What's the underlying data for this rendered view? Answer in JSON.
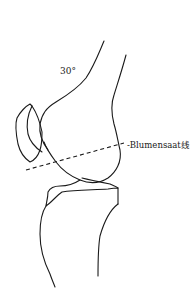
{
  "diagram": {
    "type": "knee lateral radiograph sketch",
    "angle_label": "30°",
    "line_label": "-Blumensaat线",
    "colors": {
      "stroke": "#1a1a1a",
      "background": "#ffffff"
    },
    "components": [
      "femur",
      "patella",
      "tibia",
      "blumensaat-line"
    ]
  }
}
